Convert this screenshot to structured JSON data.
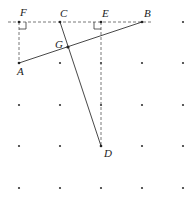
{
  "figure": {
    "grid": {
      "xs": [
        19,
        60,
        101,
        142,
        183
      ],
      "ys": [
        22,
        63,
        105,
        146,
        188
      ]
    },
    "points": {
      "F": {
        "label": "F",
        "x": 19,
        "y": 22
      },
      "C": {
        "label": "C",
        "x": 60,
        "y": 22
      },
      "E": {
        "label": "E",
        "x": 101,
        "y": 22
      },
      "B": {
        "label": "B",
        "x": 142,
        "y": 22
      },
      "A": {
        "label": "A",
        "x": 19,
        "y": 63
      },
      "G": {
        "label": "G",
        "x": 68,
        "y": 47
      },
      "D": {
        "label": "D",
        "x": 101,
        "y": 146
      }
    },
    "labels": {
      "F": "F",
      "C": "C",
      "E": "E",
      "B": "B",
      "A": "A",
      "G": "G",
      "D": "D"
    },
    "segments": [
      {
        "from": "A",
        "to": "B",
        "style": "solid"
      },
      {
        "from": "C",
        "to": "D",
        "style": "solid"
      },
      {
        "from": "F",
        "to": "A",
        "style": "dashed"
      },
      {
        "from": "E",
        "to": "D",
        "style": "dashed"
      },
      {
        "from": "F_ext",
        "to": "B_ext",
        "style": "dashed"
      }
    ],
    "right_angles": [
      "F",
      "E"
    ]
  }
}
